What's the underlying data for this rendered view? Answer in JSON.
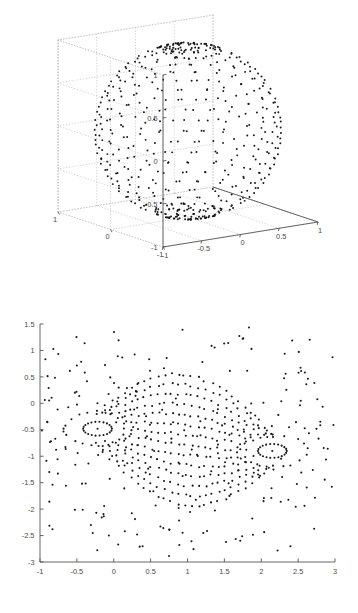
{
  "page": {
    "background_color": "#ffffff",
    "width": 358,
    "height": 613,
    "figure_count": 2
  },
  "style": {
    "marker_color": "#1a1a1a",
    "axis_color": "#555555",
    "grid_color": "#bbbbbb",
    "tick_label_color": "#4a4a4a",
    "marker_size_px": 1.9,
    "marker_shape": "dot"
  },
  "chart_data": [
    {
      "id": "sphere-scatter-3d",
      "type": "scatter",
      "projection": "3d",
      "title": "",
      "xlabel": "",
      "ylabel": "",
      "zlabel": "",
      "xlim": [
        -1,
        1
      ],
      "ylim": [
        -1,
        1
      ],
      "zlim": [
        -1,
        1
      ],
      "xticks": [
        -1,
        -0.5,
        0,
        0.5,
        1
      ],
      "xticklabels": [
        "-1",
        "-0.5",
        "0",
        "0.5",
        "1"
      ],
      "yticks": [
        -1,
        0,
        1
      ],
      "yticklabels": [
        "-1",
        "0",
        "1"
      ],
      "zticks": [
        -1,
        -0.5,
        0,
        0.5,
        1
      ],
      "zticklabels": [
        "-1",
        "-0.5",
        "0",
        "0.5",
        "1"
      ],
      "grid": true,
      "grid_style": "dotted",
      "legend": null,
      "box": true,
      "description": "Points distributed on the surface of a unit sphere, arranged along meridians with dense clustering near the two poles",
      "n_points": 620,
      "generator": {
        "method": "meridian-latitude-sphere",
        "n_meridians": 26,
        "n_latitude_bands": 26,
        "pole_cluster_count": 130,
        "pole_cluster_polar_max_deg": 22,
        "radius": 1.0,
        "seed": 20240513
      },
      "view": {
        "azimuth_deg": -37.5,
        "elevation_deg": 30,
        "origin_px": [
          163,
          247
        ],
        "x_axis_vec_px": [
          155,
          -25
        ],
        "y_axis_vec_px": [
          -105,
          -35
        ],
        "z_axis_vec_px": [
          0,
          -172
        ]
      }
    },
    {
      "id": "vortex-scatter-2d",
      "type": "scatter",
      "projection": "2d",
      "title": "",
      "xlabel": "",
      "ylabel": "",
      "xlim": [
        -1,
        3
      ],
      "ylim": [
        -3,
        1.5
      ],
      "xticks": [
        -1,
        -0.5,
        0,
        0.5,
        1,
        1.5,
        2,
        2.5,
        3
      ],
      "xticklabels": [
        "-1",
        "-0.5",
        "0",
        "0.5",
        "1",
        "1.5",
        "2",
        "2.5",
        "3"
      ],
      "yticks": [
        -3,
        -2.5,
        -2,
        -1.5,
        -1,
        -0.5,
        0,
        0.5,
        1,
        1.5
      ],
      "yticklabels": [
        "-3",
        "-2.5",
        "-2",
        "-1.5",
        "-1",
        "-0.5",
        "0",
        "0.5",
        "1",
        "1.5"
      ],
      "grid": false,
      "legend": null,
      "box": false,
      "description": "Planar projection of the sphere points showing two vortex-like singular centers surrounded by concentric rings and streamline arcs connecting them",
      "n_points": 620,
      "generator": {
        "method": "stereographic-two-vortex",
        "centers": [
          {
            "x": -0.22,
            "y": -0.48,
            "ring_counts": [
              22,
              18,
              16,
              14,
              12
            ]
          },
          {
            "x": 2.15,
            "y": -0.9,
            "ring_counts": [
              22,
              18,
              16,
              14,
              12
            ]
          }
        ],
        "ring_radii": [
          0.16,
          0.38,
          0.6,
          0.85,
          1.12
        ],
        "streamline_bands": 14,
        "points_per_band": 26,
        "seed": 20240513
      }
    }
  ]
}
